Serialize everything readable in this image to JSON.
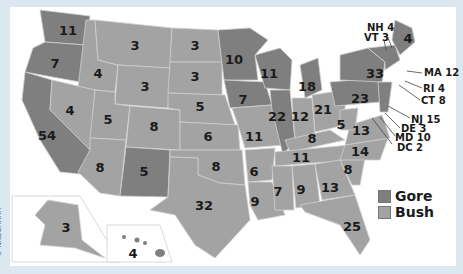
{
  "colors": {
    "gore": "#7f7f7f",
    "bush": "#a3a3a3",
    "border": "#cfcfcf",
    "frame": "#dce8ef"
  },
  "legend": [
    {
      "label": "Gore",
      "color": "#7f7f7f"
    },
    {
      "label": "Bush",
      "color": "#a3a3a3"
    }
  ],
  "credit": "© NKOCHARH",
  "states": [
    {
      "code": "WA",
      "votes": "11",
      "winner": "gore"
    },
    {
      "code": "OR",
      "votes": "7",
      "winner": "gore"
    },
    {
      "code": "CA",
      "votes": "54",
      "winner": "gore"
    },
    {
      "code": "ID",
      "votes": "4",
      "winner": "bush"
    },
    {
      "code": "NV",
      "votes": "4",
      "winner": "bush"
    },
    {
      "code": "MT",
      "votes": "3",
      "winner": "bush"
    },
    {
      "code": "WY",
      "votes": "3",
      "winner": "bush"
    },
    {
      "code": "UT",
      "votes": "5",
      "winner": "bush"
    },
    {
      "code": "AZ",
      "votes": "8",
      "winner": "bush"
    },
    {
      "code": "CO",
      "votes": "8",
      "winner": "bush"
    },
    {
      "code": "NM",
      "votes": "5",
      "winner": "gore"
    },
    {
      "code": "ND",
      "votes": "3",
      "winner": "bush"
    },
    {
      "code": "SD",
      "votes": "3",
      "winner": "bush"
    },
    {
      "code": "NE",
      "votes": "5",
      "winner": "bush"
    },
    {
      "code": "KS",
      "votes": "6",
      "winner": "bush"
    },
    {
      "code": "OK",
      "votes": "8",
      "winner": "bush"
    },
    {
      "code": "TX",
      "votes": "32",
      "winner": "bush"
    },
    {
      "code": "MN",
      "votes": "10",
      "winner": "gore"
    },
    {
      "code": "IA",
      "votes": "7",
      "winner": "gore"
    },
    {
      "code": "MO",
      "votes": "11",
      "winner": "bush"
    },
    {
      "code": "AR",
      "votes": "6",
      "winner": "bush"
    },
    {
      "code": "LA",
      "votes": "9",
      "winner": "bush"
    },
    {
      "code": "WI",
      "votes": "11",
      "winner": "gore"
    },
    {
      "code": "IL",
      "votes": "22",
      "winner": "gore"
    },
    {
      "code": "MI",
      "votes": "18",
      "winner": "gore"
    },
    {
      "code": "IN",
      "votes": "12",
      "winner": "bush"
    },
    {
      "code": "OH",
      "votes": "21",
      "winner": "bush"
    },
    {
      "code": "KY",
      "votes": "8",
      "winner": "bush"
    },
    {
      "code": "TN",
      "votes": "11",
      "winner": "bush"
    },
    {
      "code": "MS",
      "votes": "7",
      "winner": "bush"
    },
    {
      "code": "AL",
      "votes": "9",
      "winner": "bush"
    },
    {
      "code": "GA",
      "votes": "13",
      "winner": "bush"
    },
    {
      "code": "FL",
      "votes": "25",
      "winner": "bush"
    },
    {
      "code": "SC",
      "votes": "8",
      "winner": "bush"
    },
    {
      "code": "NC",
      "votes": "14",
      "winner": "bush"
    },
    {
      "code": "VA",
      "votes": "13",
      "winner": "bush"
    },
    {
      "code": "WV",
      "votes": "5",
      "winner": "bush"
    },
    {
      "code": "PA",
      "votes": "23",
      "winner": "gore"
    },
    {
      "code": "NY",
      "votes": "33",
      "winner": "gore"
    },
    {
      "code": "ME",
      "votes": "4",
      "winner": "gore"
    },
    {
      "code": "AK",
      "votes": "3",
      "winner": "bush"
    },
    {
      "code": "HI",
      "votes": "4",
      "winner": "gore"
    }
  ],
  "callouts": [
    {
      "label": "NH 4"
    },
    {
      "label": "VT 3"
    },
    {
      "label": "MA 12"
    },
    {
      "label": "RI 4"
    },
    {
      "label": "CT 8"
    },
    {
      "label": "NJ 15"
    },
    {
      "label": "DE 3"
    },
    {
      "label": "MD 10"
    },
    {
      "label": "DC 2"
    }
  ]
}
